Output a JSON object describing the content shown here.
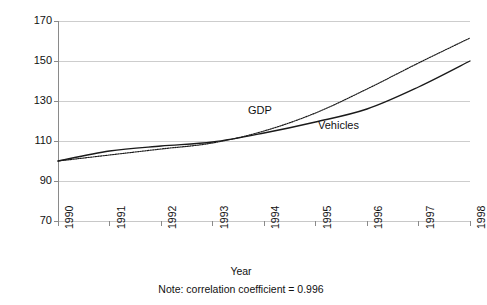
{
  "chart_data": {
    "type": "line",
    "title": "",
    "xlabel": "Year",
    "ylabel": "Index (1990 = 100)",
    "x": [
      1990,
      1991,
      1992,
      1993,
      1994,
      1995,
      1996,
      1997,
      1998
    ],
    "categories": [
      "1990",
      "1991",
      "1992",
      "1993",
      "1994",
      "1995",
      "1996",
      "1997",
      "1998"
    ],
    "xlim": [
      1990,
      1998
    ],
    "ylim": [
      70,
      170
    ],
    "yticks": [
      70,
      90,
      110,
      130,
      150,
      170
    ],
    "ytick_labels": [
      "70",
      "90",
      "110",
      "130",
      "150",
      "170"
    ],
    "grid": "horizontal",
    "legend": "inline-labels",
    "series": [
      {
        "name": "GDP",
        "style": "dotted",
        "color": "#1a1a1a",
        "values": [
          100,
          103,
          106,
          109,
          115,
          124,
          136,
          149,
          161.5
        ]
      },
      {
        "name": "Vehicles",
        "style": "solid",
        "color": "#1a1a1a",
        "values": [
          100,
          105,
          107.5,
          109.5,
          114,
          119.5,
          126,
          137,
          150
        ]
      }
    ],
    "annotations": [
      {
        "text": "GDP",
        "x": 1994.0,
        "y": 130
      },
      {
        "text": "Vehicles",
        "x": 1995.4,
        "y": 124
      }
    ],
    "note": "Note: correlation coefficient = 0.996",
    "correlation_coefficient": "0.996"
  },
  "axis": {
    "y_title": "Index (1990 = 100)",
    "x_title": "Year",
    "y_ticks": [
      "170",
      "150",
      "130",
      "110",
      "90",
      "70"
    ],
    "x_ticks": [
      "1990",
      "1991",
      "1992",
      "1993",
      "1994",
      "1995",
      "1996",
      "1997",
      "1998"
    ]
  },
  "labels": {
    "gdp": "GDP",
    "vehicles": "Vehicles"
  },
  "footer": {
    "note": "Note: correlation coefficient = 0.996"
  },
  "colors": {
    "line": "#1a1a1a",
    "grid": "#c8c8c8",
    "axis": "#808080",
    "background": "#ffffff",
    "text": "#111111"
  }
}
